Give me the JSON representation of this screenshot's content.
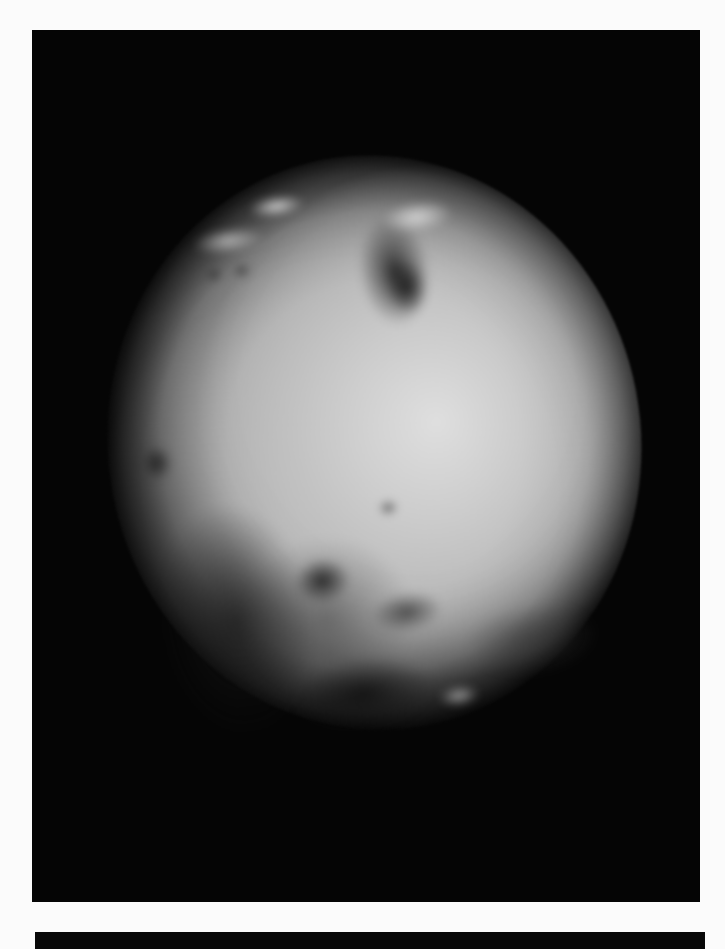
{
  "page": {
    "background": "#fbfbfb"
  },
  "photo": {
    "subject": "grayscale photograph of a cratered moon (Io) against black space",
    "frame_color": "#050505",
    "features": [
      {
        "name": "dark-patch-north",
        "x": 275,
        "y": 65,
        "w": 70,
        "h": 110,
        "color": "rgba(25,25,25,0.85)"
      },
      {
        "name": "dark-patch-north-b",
        "x": 300,
        "y": 110,
        "w": 40,
        "h": 55,
        "color": "rgba(10,10,10,0.8)"
      },
      {
        "name": "bright-cap-north",
        "x": 175,
        "y": 30,
        "w": 55,
        "h": 20,
        "color": "rgba(235,235,235,0.9)"
      },
      {
        "name": "bright-patch-ne",
        "x": 305,
        "y": 55,
        "w": 70,
        "h": 30,
        "color": "rgba(230,230,230,0.8)"
      },
      {
        "name": "bright-streak-nw",
        "x": 115,
        "y": 55,
        "w": 70,
        "h": 25,
        "color": "rgba(225,225,225,0.7)"
      },
      {
        "name": "dark-spot-west",
        "x": 33,
        "y": 260,
        "w": 30,
        "h": 35,
        "color": "rgba(20,20,20,0.8)"
      },
      {
        "name": "dark-spot-small-a",
        "x": 122,
        "y": 92,
        "w": 18,
        "h": 14,
        "color": "rgba(40,40,40,0.8)"
      },
      {
        "name": "dark-spot-small-b",
        "x": 150,
        "y": 92,
        "w": 18,
        "h": 14,
        "color": "rgba(40,40,40,0.8)"
      },
      {
        "name": "dark-spot-center",
        "x": 262,
        "y": 347,
        "w": 18,
        "h": 14,
        "color": "rgba(40,40,40,0.8)"
      },
      {
        "name": "dark-crater-south",
        "x": 168,
        "y": 395,
        "w": 55,
        "h": 45,
        "color": "rgba(10,10,10,0.9)"
      },
      {
        "name": "dark-ring-south",
        "x": 110,
        "y": 375,
        "w": 170,
        "h": 160,
        "color": "rgba(70,70,70,0.55)"
      },
      {
        "name": "dark-patch-south-b",
        "x": 240,
        "y": 440,
        "w": 70,
        "h": 40,
        "color": "rgba(45,45,45,0.75)"
      },
      {
        "name": "dark-limb-sw",
        "x": 30,
        "y": 330,
        "w": 150,
        "h": 230,
        "color": "rgba(20,20,20,0.7)"
      },
      {
        "name": "dark-limb-south",
        "x": 150,
        "y": 500,
        "w": 140,
        "h": 70,
        "color": "rgba(15,15,15,0.85)"
      },
      {
        "name": "dark-mottling-se",
        "x": 330,
        "y": 470,
        "w": 130,
        "h": 70,
        "color": "rgba(60,60,60,0.55)"
      },
      {
        "name": "bright-spot-south",
        "x": 295,
        "y": 540,
        "w": 40,
        "h": 20,
        "color": "rgba(210,210,210,0.7)"
      }
    ]
  }
}
